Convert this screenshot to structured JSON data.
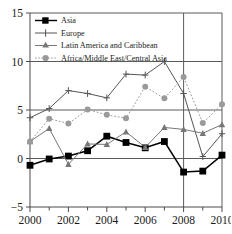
{
  "chart_data": {
    "type": "line",
    "title": "",
    "subtitle": "",
    "xlabel": "",
    "ylabel": "",
    "x": [
      2000,
      2001,
      2002,
      2003,
      2004,
      2005,
      2006,
      2007,
      2008,
      2009,
      2010
    ],
    "xlim": [
      2000,
      2010
    ],
    "ylim": [
      -5,
      15
    ],
    "xticks": [
      2000,
      2002,
      2004,
      2006,
      2008,
      2010
    ],
    "xtick_labels": [
      "2000",
      "2002",
      "2004",
      "2006",
      "2008",
      "2010"
    ],
    "xminor_ticks": [
      2001,
      2003,
      2005,
      2007,
      2009
    ],
    "yticks": [
      -5,
      0,
      5,
      10,
      15
    ],
    "ytick_labels": [
      "−5",
      "0",
      "5",
      "10",
      "15"
    ],
    "grid": "horizontal-major-plus-vertical-2008",
    "vertical_reference_line": 2008,
    "legend_position": "top-left-inside",
    "series": [
      {
        "name": "Asia",
        "marker": "filled-square",
        "color": "#000000",
        "linestyle": "solid",
        "values": [
          -0.7,
          -0.05,
          0.25,
          0.8,
          2.3,
          1.65,
          1.1,
          1.75,
          -1.4,
          -1.3,
          0.35
        ]
      },
      {
        "name": "Europe",
        "marker": "plus",
        "color": "#555555",
        "linestyle": "solid",
        "values": [
          4.2,
          5.15,
          7.0,
          6.7,
          6.25,
          8.7,
          8.6,
          10.0,
          6.7,
          0.2,
          2.55
        ]
      },
      {
        "name": "Latin America and Caribbean",
        "marker": "triangle",
        "color": "#777777",
        "linestyle": "solid",
        "values": [
          1.75,
          3.1,
          -0.6,
          1.5,
          1.45,
          2.75,
          1.15,
          3.2,
          3.0,
          2.6,
          3.5
        ]
      },
      {
        "name": "Africa/Middle East/Central Asia",
        "marker": "circle",
        "color": "#9a9a9a",
        "linestyle": "dotted",
        "values": [
          1.75,
          4.1,
          3.6,
          5.05,
          4.5,
          4.15,
          7.4,
          6.2,
          8.4,
          3.65,
          5.6
        ]
      }
    ]
  },
  "legend": {
    "entries": [
      {
        "label": "Asia"
      },
      {
        "label": "Europe"
      },
      {
        "label": "Latin America and Caribbean"
      },
      {
        "label": "Africa/Middle East/Central Asia"
      }
    ]
  },
  "axes": {
    "y_labels": [
      "15",
      "10",
      "5",
      "0",
      "−5"
    ],
    "x_labels": [
      "2000",
      "2002",
      "2004",
      "2006",
      "2008",
      "2010"
    ]
  }
}
